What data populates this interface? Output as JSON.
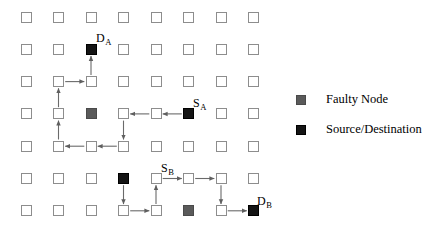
{
  "figure": {
    "type": "network-routing-diagram",
    "grid": {
      "rows": 7,
      "cols": 8,
      "origin_x": 26,
      "origin_y": 17,
      "dx": 32.5,
      "dy": 32.3,
      "node_size": 11
    },
    "colors": {
      "normal_node_border": "#8d8d8d",
      "normal_node_fill": "#ffffff",
      "faulty_node": "#5a5a5a",
      "endpoint_node": "#141414",
      "link": "#6a6a6a",
      "text": "#000000",
      "background": "#ffffff"
    },
    "nodes": {
      "faulty": [
        {
          "row": 3,
          "col": 2
        },
        {
          "row": 6,
          "col": 5
        }
      ],
      "endpoints": [
        {
          "row": 1,
          "col": 2,
          "name": "D_A"
        },
        {
          "row": 3,
          "col": 5,
          "name": "S_A"
        },
        {
          "row": 5,
          "col": 3,
          "name": "S_B"
        },
        {
          "row": 6,
          "col": 7,
          "name": "D_B"
        }
      ]
    },
    "labels": [
      {
        "id": "label-da",
        "base": "D",
        "sub": "A",
        "x": 96,
        "y": 32
      },
      {
        "id": "label-sa",
        "base": "S",
        "sub": "A",
        "x": 193,
        "y": 97
      },
      {
        "id": "label-sb",
        "base": "S",
        "sub": "B",
        "x": 161,
        "y": 162
      },
      {
        "id": "label-db",
        "base": "D",
        "sub": "B",
        "x": 257,
        "y": 195
      }
    ],
    "paths": [
      {
        "id": "path-a",
        "from": "S_A",
        "to": "D_A",
        "segments": [
          {
            "r1": 3,
            "c1": 5,
            "r2": 3,
            "c2": 4,
            "dir": "left"
          },
          {
            "r1": 3,
            "c1": 4,
            "r2": 3,
            "c2": 3,
            "dir": "left"
          },
          {
            "r1": 3,
            "c1": 3,
            "r2": 4,
            "c2": 3,
            "dir": "down"
          },
          {
            "r1": 4,
            "c1": 3,
            "r2": 4,
            "c2": 2,
            "dir": "left"
          },
          {
            "r1": 4,
            "c1": 2,
            "r2": 4,
            "c2": 1,
            "dir": "left"
          },
          {
            "r1": 4,
            "c1": 1,
            "r2": 3,
            "c2": 1,
            "dir": "up"
          },
          {
            "r1": 3,
            "c1": 1,
            "r2": 2,
            "c2": 1,
            "dir": "up"
          },
          {
            "r1": 2,
            "c1": 1,
            "r2": 2,
            "c2": 2,
            "dir": "right"
          },
          {
            "r1": 2,
            "c1": 2,
            "r2": 1,
            "c2": 2,
            "dir": "up"
          }
        ]
      },
      {
        "id": "path-b",
        "from": "S_B",
        "to": "D_B",
        "segments": [
          {
            "r1": 5,
            "c1": 3,
            "r2": 6,
            "c2": 3,
            "dir": "down"
          },
          {
            "r1": 6,
            "c1": 3,
            "r2": 6,
            "c2": 4,
            "dir": "right"
          },
          {
            "r1": 6,
            "c1": 4,
            "r2": 5,
            "c2": 4,
            "dir": "up"
          },
          {
            "r1": 5,
            "c1": 4,
            "r2": 5,
            "c2": 5,
            "dir": "right"
          },
          {
            "r1": 5,
            "c1": 5,
            "r2": 5,
            "c2": 6,
            "dir": "right"
          },
          {
            "r1": 5,
            "c1": 6,
            "r2": 6,
            "c2": 6,
            "dir": "down"
          },
          {
            "r1": 6,
            "c1": 6,
            "r2": 6,
            "c2": 7,
            "dir": "right"
          }
        ]
      }
    ]
  },
  "legend": {
    "items": [
      {
        "id": "legend-faulty",
        "swatch": "faulty",
        "label": "Faulty Node",
        "x": 296,
        "y": 92
      },
      {
        "id": "legend-endpoint",
        "swatch": "endpoint",
        "label": "Source/Destination",
        "x": 296,
        "y": 122
      }
    ]
  }
}
